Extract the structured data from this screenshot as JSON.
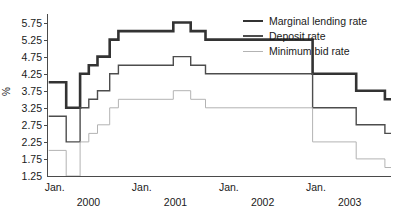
{
  "chart_data": {
    "type": "line",
    "title": "",
    "subtitle": "",
    "xlabel": "",
    "ylabel": "%",
    "ylim": [
      1.25,
      6.0
    ],
    "yticks": [
      1.25,
      1.75,
      2.25,
      2.75,
      3.25,
      3.75,
      4.25,
      4.75,
      5.25,
      5.75
    ],
    "ytick_labels": [
      "1.25",
      "1.75",
      "2.25",
      "2.75",
      "3.25",
      "3.75",
      "4.25",
      "4.75",
      "5.25",
      "5.75"
    ],
    "xlim": [
      1999.9,
      2003.85
    ],
    "xticks": [
      2000.0,
      2001.0,
      2002.0,
      2003.0
    ],
    "xtick_labels": [
      "Jan.",
      "Jan.",
      "Jan.",
      "Jan."
    ],
    "xtick_sublabels": [
      "2000",
      "2001",
      "2002",
      "2003"
    ],
    "grid": false,
    "drawstyle": "steps-post",
    "legend_position": "top-right",
    "series": [
      {
        "name": "Marginal lending rate",
        "color": "#333333",
        "linewidth": 2.6,
        "x": [
          1999.92,
          2000.12,
          2000.28,
          2000.38,
          2000.48,
          2000.62,
          2000.72,
          2001.35,
          2001.55,
          2001.72,
          2002.95,
          2003.45,
          2003.78
        ],
        "values": [
          4.0,
          3.25,
          4.25,
          4.5,
          4.75,
          5.25,
          5.5,
          5.75,
          5.5,
          5.25,
          4.25,
          3.75,
          3.5
        ]
      },
      {
        "name": "Deposit rate",
        "color": "#4d4d4d",
        "linewidth": 1.4,
        "x": [
          1999.92,
          2000.12,
          2000.28,
          2000.38,
          2000.48,
          2000.62,
          2000.72,
          2001.35,
          2001.55,
          2001.72,
          2002.95,
          2003.45,
          2003.78
        ],
        "values": [
          3.0,
          2.25,
          3.25,
          3.5,
          3.75,
          4.25,
          4.5,
          4.75,
          4.5,
          4.25,
          3.25,
          2.75,
          2.5
        ]
      },
      {
        "name": "Minimum bid rate",
        "color": "#b3b3b3",
        "linewidth": 1.0,
        "x": [
          1999.92,
          2000.12,
          2000.28,
          2000.38,
          2000.48,
          2000.62,
          2000.72,
          2001.35,
          2001.55,
          2001.72,
          2002.95,
          2003.45,
          2003.78
        ],
        "values": [
          2.0,
          1.25,
          2.25,
          2.5,
          2.75,
          3.25,
          3.5,
          3.75,
          3.5,
          3.25,
          2.25,
          1.75,
          1.5
        ]
      }
    ]
  },
  "legend": {
    "items": [
      {
        "label": "Marginal lending rate",
        "swatch": "line-thick-dark"
      },
      {
        "label": "Deposit rate",
        "swatch": "line-medium-dark"
      },
      {
        "label": "Minimum bid rate",
        "swatch": "line-thin-light"
      }
    ]
  }
}
